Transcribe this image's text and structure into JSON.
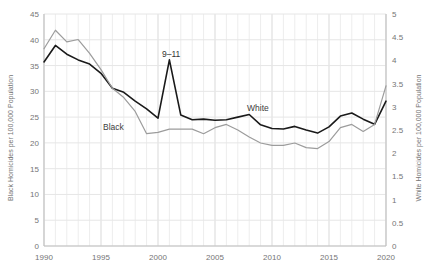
{
  "chart_data": {
    "type": "line",
    "title": "",
    "xlabel": "",
    "x": [
      1990,
      1991,
      1992,
      1993,
      1994,
      1995,
      1996,
      1997,
      1998,
      1999,
      2000,
      2001,
      2002,
      2003,
      2004,
      2005,
      2006,
      2007,
      2008,
      2009,
      2010,
      2011,
      2012,
      2013,
      2014,
      2015,
      2016,
      2017,
      2018,
      2019,
      2020
    ],
    "xlim": [
      1990,
      2020
    ],
    "xticks": [
      1990,
      1995,
      2000,
      2005,
      2010,
      2015,
      2020
    ],
    "xtick_labels": [
      "1990",
      "1995",
      "2000",
      "2005",
      "2010",
      "2015",
      "2020"
    ],
    "grid": true,
    "grid_minor_x": true,
    "legend": "inline-labels",
    "series": [
      {
        "name": "Black",
        "axis": "left",
        "color": "#1a1a1a",
        "label_text": "Black",
        "ylabel": "Black Homicides per 100,000 Population",
        "ylim": [
          0,
          45
        ],
        "yticks": [
          0,
          5,
          10,
          15,
          20,
          25,
          30,
          35,
          40,
          45
        ],
        "ytick_labels": [
          "0",
          "5",
          "10",
          "15",
          "20",
          "25",
          "30",
          "35",
          "40",
          "45"
        ],
        "values": [
          35.7,
          38.9,
          37.2,
          36.1,
          35.3,
          33.5,
          30.6,
          29.8,
          28.1,
          26.6,
          24.8,
          36.1,
          25.4,
          24.5,
          24.6,
          24.4,
          24.5,
          25.0,
          25.5,
          23.5,
          22.8,
          22.7,
          23.2,
          22.5,
          21.9,
          23.1,
          25.2,
          25.8,
          24.6,
          23.6,
          28.1
        ]
      },
      {
        "name": "White",
        "axis": "right",
        "color": "#9c9c9c",
        "label_text": "White",
        "ylabel": "White Homicides per 100,000 Population",
        "ylim": [
          0,
          5
        ],
        "yticks": [
          0,
          0.5,
          1,
          1.5,
          2,
          2.5,
          3,
          3.5,
          4,
          4.5,
          5
        ],
        "ytick_labels": [
          "0",
          "0.5",
          "1",
          "1.5",
          "2",
          "2.5",
          "3",
          "3.5",
          "4",
          "4.5",
          "5"
        ],
        "values": [
          4.25,
          4.65,
          4.4,
          4.45,
          4.15,
          3.8,
          3.4,
          3.2,
          2.9,
          2.42,
          2.45,
          2.52,
          2.52,
          2.52,
          2.42,
          2.55,
          2.62,
          2.5,
          2.35,
          2.22,
          2.17,
          2.17,
          2.22,
          2.12,
          2.1,
          2.25,
          2.55,
          2.62,
          2.47,
          2.62,
          3.45
        ]
      }
    ],
    "annotations": [
      {
        "name": "nine-eleven",
        "text": "9–11",
        "x": 2001,
        "y": 36.1,
        "axis": "left"
      }
    ]
  }
}
